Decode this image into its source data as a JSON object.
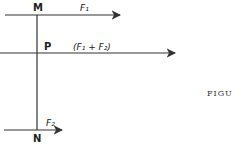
{
  "diagram": {
    "points": {
      "M": "M",
      "P": "P",
      "N": "N"
    },
    "forces": {
      "top": "F₁",
      "middle": "(F₁ + F₂)",
      "bottom": "F₂"
    },
    "figure_label": "FIGU"
  }
}
